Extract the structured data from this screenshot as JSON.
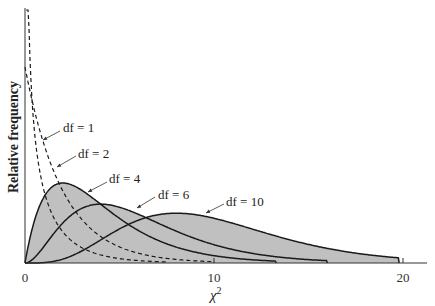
{
  "chart_data": {
    "type": "line",
    "title": "",
    "xlabel": "χ²",
    "xlabel_base": "χ",
    "xlabel_sup": "2",
    "ylabel": "Relative frequency",
    "xlim": [
      0,
      21
    ],
    "ylim": [
      0,
      0.6
    ],
    "x_ticks": [
      0,
      10,
      20
    ],
    "x_tick_labels": [
      "0",
      "10",
      "20"
    ],
    "grid": false,
    "legend": "inline annotations with arrows",
    "fill_color": "#c0c0c0",
    "line_color": "#1a1a1a",
    "series": [
      {
        "name": "df = 1",
        "df": 1,
        "style": "dashed",
        "filled": false,
        "peak_x": 0,
        "end_x": 7.5
      },
      {
        "name": "df = 2",
        "df": 2,
        "style": "dashed",
        "filled": false,
        "peak_x": 0,
        "peak_y": 0.5,
        "end_x": 10
      },
      {
        "name": "df = 4",
        "df": 4,
        "style": "solid",
        "filled": true,
        "peak_x": 2,
        "peak_y": 0.184,
        "end_x": 13.3
      },
      {
        "name": "df = 6",
        "df": 6,
        "style": "solid",
        "filled": true,
        "peak_x": 4,
        "peak_y": 0.135,
        "end_x": 16
      },
      {
        "name": "df = 10",
        "df": 10,
        "style": "solid",
        "filled": true,
        "peak_x": 8,
        "peak_y": 0.098,
        "end_x": 19.8
      }
    ],
    "annotations": [
      {
        "text": "df = 1",
        "label_x": 62,
        "label_y": 131,
        "arrow_from": [
          60,
          131
        ],
        "arrow_to": [
          43,
          140
        ]
      },
      {
        "text": "df = 2",
        "label_x": 77,
        "label_y": 157,
        "arrow_from": [
          76,
          156
        ],
        "arrow_to": [
          57,
          167
        ]
      },
      {
        "text": "df = 4",
        "label_x": 108,
        "label_y": 182,
        "arrow_from": [
          107,
          182
        ],
        "arrow_to": [
          88,
          192
        ]
      },
      {
        "text": "df = 6",
        "label_x": 157,
        "label_y": 198,
        "arrow_from": [
          155,
          197
        ],
        "arrow_to": [
          137,
          208
        ]
      },
      {
        "text": "df = 10",
        "label_x": 225,
        "label_y": 205,
        "arrow_from": [
          224,
          204
        ],
        "arrow_to": [
          206,
          213
        ]
      }
    ]
  }
}
